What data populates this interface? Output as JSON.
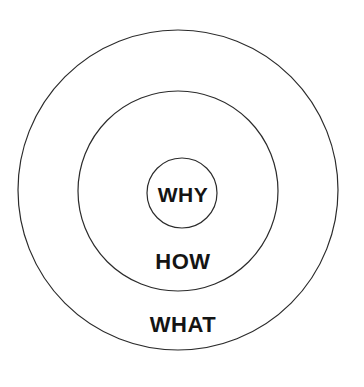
{
  "diagram": {
    "name": "golden-circle",
    "background_color": "#ffffff",
    "stroke_color": "#2b2b2b",
    "text_color": "#141414",
    "rings": [
      {
        "id": "outer",
        "label": "WHAT",
        "center_x": 178,
        "center_y": 190,
        "radius": 160,
        "stroke_width": 1.2,
        "label_x": 183,
        "label_y": 325
      },
      {
        "id": "middle",
        "label": "HOW",
        "center_x": 178,
        "center_y": 191,
        "radius": 100,
        "stroke_width": 1.2,
        "label_x": 183,
        "label_y": 262
      },
      {
        "id": "inner",
        "label": "WHY",
        "center_x": 182,
        "center_y": 193,
        "radius": 35,
        "stroke_width": 1.2,
        "label_x": 183,
        "label_y": 195
      }
    ]
  }
}
